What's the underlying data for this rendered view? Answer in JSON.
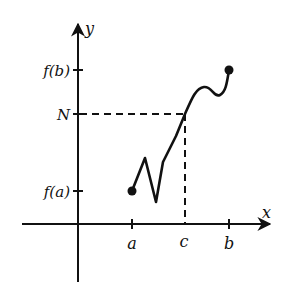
{
  "diagram": {
    "type": "intermediate-value-theorem",
    "axes": {
      "x_label": "x",
      "y_label": "y"
    },
    "x_ticks": [
      {
        "label": "a",
        "x": 132
      },
      {
        "label": "c",
        "x": 185
      },
      {
        "label": "b",
        "x": 229
      }
    ],
    "y_ticks": [
      {
        "label": "f(b)",
        "y": 70
      },
      {
        "label": "N",
        "y": 114
      },
      {
        "label": "f(a)",
        "y": 191
      }
    ],
    "endpoints": [
      {
        "name": "start",
        "x": 132,
        "y": 191
      },
      {
        "name": "end",
        "x": 229,
        "y": 70
      }
    ],
    "guide_lines": {
      "horizontal": "dashed line from y-axis at N to curve at x=c",
      "vertical": "dashed line from curve down to x-axis at c"
    },
    "colors": {
      "ink": "#111111",
      "background": "#ffffff"
    }
  }
}
